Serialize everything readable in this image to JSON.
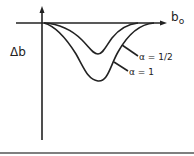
{
  "diagram": {
    "y_axis_label": "Δb",
    "x_axis_label": "b",
    "x_axis_subscript": "o",
    "curves": [
      {
        "label": "α = 1/2",
        "min_depth": "shallow"
      },
      {
        "label": "α = 1",
        "min_depth": "deep"
      }
    ]
  },
  "colors": {
    "ink": "#222222",
    "background": "#ffffff"
  }
}
